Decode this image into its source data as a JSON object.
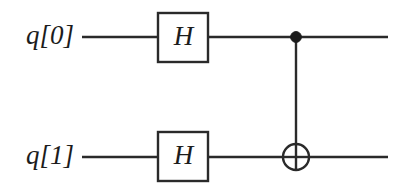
{
  "diagram": {
    "kind": "quantum-circuit",
    "background_color": "#ffffff",
    "ink_color": "#2a2a2a",
    "text_color": "#1c1c1c",
    "canvas": {
      "width": 411,
      "height": 189
    }
  },
  "wires": [
    {
      "id": "q0",
      "label": "q[0]",
      "label_x": 74,
      "label_y": 37,
      "y": 37,
      "x_start": 82,
      "x_end": 388
    },
    {
      "id": "q1",
      "label": "q[1]",
      "label_x": 74,
      "label_y": 157,
      "y": 157,
      "x_start": 82,
      "x_end": 388
    }
  ],
  "gates": [
    {
      "id": "h-q0",
      "type": "hadamard",
      "label": "H",
      "wire": "q[0]",
      "x": 158,
      "y": 13,
      "width": 50,
      "height": 49,
      "center_x": 183,
      "center_y": 37
    },
    {
      "id": "h-q1",
      "type": "hadamard",
      "label": "H",
      "wire": "q[1]",
      "x": 158,
      "y": 132,
      "width": 50,
      "height": 49,
      "center_x": 183,
      "center_y": 157
    }
  ],
  "cnot": {
    "id": "cnot-q0-q1",
    "type": "controlled-not",
    "control_wire": "q[0]",
    "target_wire": "q[1]",
    "x": 296,
    "control_y": 37,
    "control_radius": 5.4,
    "target_y": 157,
    "target_radius": 13,
    "link_y_start": 37,
    "link_y_end": 157
  }
}
